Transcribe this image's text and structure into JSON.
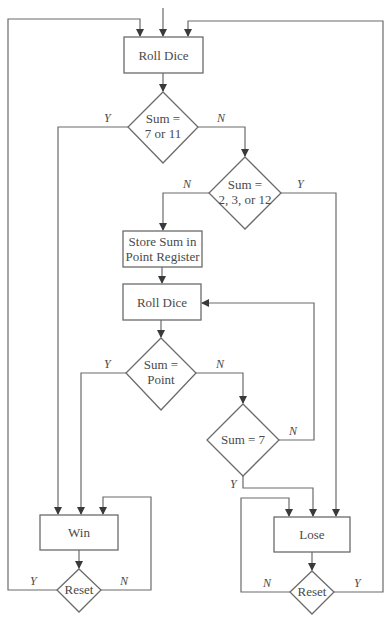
{
  "diagram": {
    "type": "flowchart",
    "title": "",
    "nodes": [
      {
        "id": "roll1",
        "shape": "process",
        "label": "Roll Dice"
      },
      {
        "id": "d1",
        "shape": "decision",
        "line1": "Sum =",
        "line2": "7 or 11"
      },
      {
        "id": "d2",
        "shape": "decision",
        "line1": "Sum =",
        "line2": "2, 3, or 12"
      },
      {
        "id": "store",
        "shape": "process",
        "line1": "Store Sum in",
        "line2": "Point Register"
      },
      {
        "id": "roll2",
        "shape": "process",
        "label": "Roll Dice"
      },
      {
        "id": "d3",
        "shape": "decision",
        "line1": "Sum =",
        "line2": "Point"
      },
      {
        "id": "d4",
        "shape": "decision",
        "label": "Sum = 7"
      },
      {
        "id": "win",
        "shape": "process",
        "label": "Win"
      },
      {
        "id": "lose",
        "shape": "process",
        "label": "Lose"
      },
      {
        "id": "reset1",
        "shape": "decision",
        "label": "Reset"
      },
      {
        "id": "reset2",
        "shape": "decision",
        "label": "Reset"
      }
    ],
    "edge_labels": {
      "d1_yes": "Y",
      "d1_no": "N",
      "d2_no": "N",
      "d2_yes": "Y",
      "d3_yes": "Y",
      "d3_no": "N",
      "d4_no": "N",
      "d4_yes": "Y",
      "reset1_yes": "Y",
      "reset1_no": "N",
      "reset2_no": "N",
      "reset2_yes": "Y"
    },
    "edges": [
      {
        "from": "start",
        "to": "roll1"
      },
      {
        "from": "roll1",
        "to": "d1"
      },
      {
        "from": "d1",
        "to": "win",
        "label": "Y"
      },
      {
        "from": "d1",
        "to": "d2",
        "label": "N"
      },
      {
        "from": "d2",
        "to": "store",
        "label": "N"
      },
      {
        "from": "d2",
        "to": "lose",
        "label": "Y"
      },
      {
        "from": "store",
        "to": "roll2"
      },
      {
        "from": "roll2",
        "to": "d3"
      },
      {
        "from": "d3",
        "to": "win",
        "label": "Y"
      },
      {
        "from": "d3",
        "to": "d4",
        "label": "N"
      },
      {
        "from": "d4",
        "to": "roll2",
        "label": "N"
      },
      {
        "from": "d4",
        "to": "lose",
        "label": "Y"
      },
      {
        "from": "win",
        "to": "reset1"
      },
      {
        "from": "reset1",
        "to": "roll1",
        "label": "Y"
      },
      {
        "from": "reset1",
        "to": "win",
        "label": "N"
      },
      {
        "from": "lose",
        "to": "reset2"
      },
      {
        "from": "reset2",
        "to": "lose",
        "label": "N"
      },
      {
        "from": "reset2",
        "to": "roll1",
        "label": "Y"
      }
    ]
  },
  "colors": {
    "line": "#6b6b6b",
    "text": "#4a4a4a",
    "background": "#ffffff"
  }
}
